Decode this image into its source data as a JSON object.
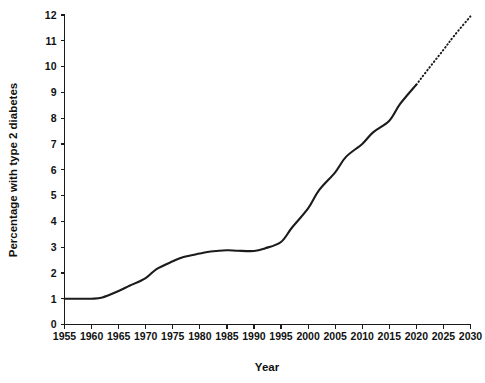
{
  "chart_data": {
    "type": "line",
    "title": "",
    "subtitle": "",
    "xlabel": "Year",
    "ylabel": "Percentage with type 2 diabetes",
    "xlim": [
      1955,
      2030
    ],
    "ylim": [
      0,
      12
    ],
    "xticks": [
      1955,
      1960,
      1965,
      1970,
      1975,
      1980,
      1985,
      1990,
      1995,
      2000,
      2005,
      2010,
      2015,
      2020,
      2025,
      2030
    ],
    "yticks": [
      0,
      1,
      2,
      3,
      4,
      5,
      6,
      7,
      8,
      9,
      10,
      11,
      12
    ],
    "grid": false,
    "legend": false,
    "legend_position": "none",
    "line_color": "#1b1b1b",
    "background_color": "#ffffff",
    "series": [
      {
        "name": "Observed",
        "style": "solid",
        "x": [
          1955,
          1957,
          1960,
          1962,
          1965,
          1967,
          1970,
          1972,
          1975,
          1977,
          1980,
          1982,
          1985,
          1987,
          1990,
          1992,
          1995,
          1997,
          2000,
          2002,
          2005,
          2007,
          2010,
          2012,
          2015,
          2017,
          2020
        ],
        "values": [
          1.0,
          1.0,
          1.0,
          1.05,
          1.3,
          1.5,
          1.8,
          2.15,
          2.45,
          2.62,
          2.75,
          2.83,
          2.88,
          2.86,
          2.85,
          2.95,
          3.2,
          3.75,
          4.5,
          5.2,
          5.9,
          6.5,
          7.0,
          7.45,
          7.9,
          8.55,
          9.3
        ]
      },
      {
        "name": "Projected",
        "style": "dotted",
        "x": [
          2020,
          2022,
          2025,
          2027,
          2030
        ],
        "values": [
          9.3,
          9.85,
          10.65,
          11.2,
          11.95
        ]
      }
    ],
    "annotations": [
      "Solid line shows observed trend from 1955 to 2020",
      "Dotted line shows projected trend from 2020 to 2030"
    ]
  },
  "axes": {
    "x_title": "Year",
    "y_title": "Percentage with type 2 diabetes",
    "x_tick_labels": [
      "1955",
      "1960",
      "1965",
      "1970",
      "1975",
      "1980",
      "1985",
      "1990",
      "1995",
      "2000",
      "2005",
      "2010",
      "2015",
      "2020",
      "2025",
      "2030"
    ],
    "y_tick_labels": [
      "0",
      "1",
      "2",
      "3",
      "4",
      "5",
      "6",
      "7",
      "8",
      "9",
      "10",
      "11",
      "12"
    ]
  }
}
